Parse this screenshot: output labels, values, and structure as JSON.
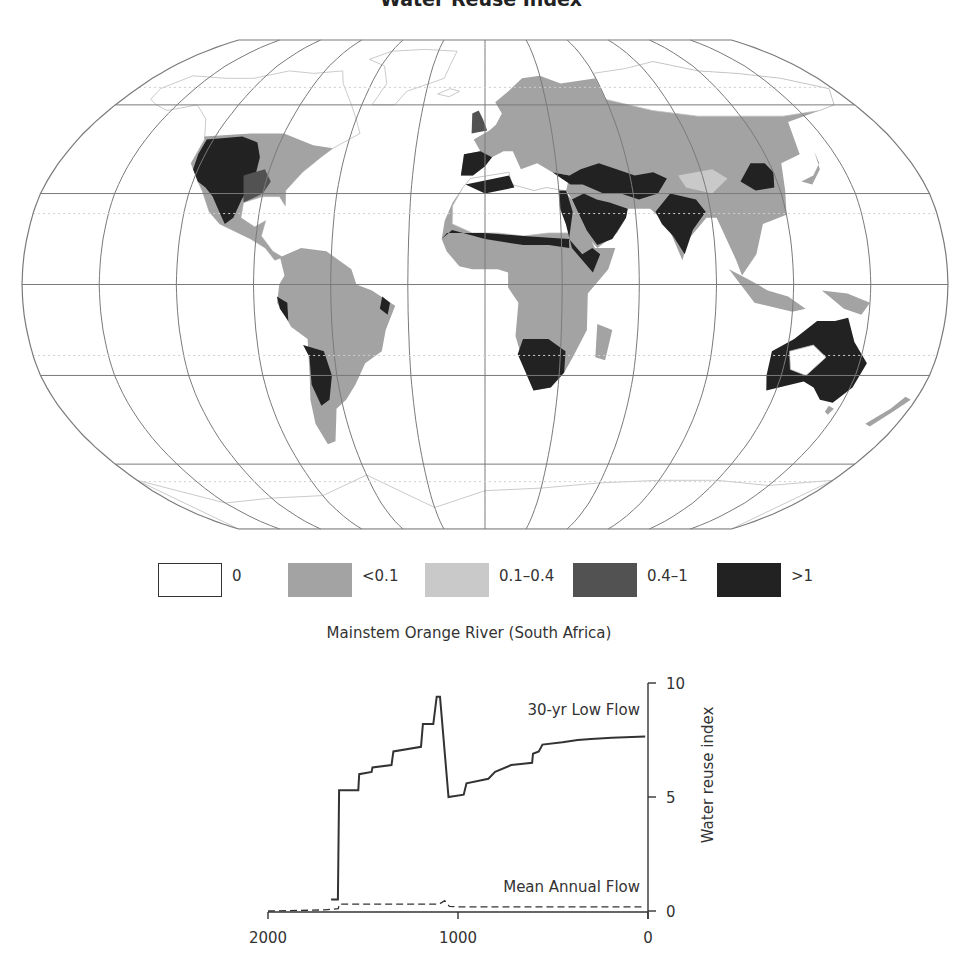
{
  "map": {
    "title": "Water Reuse Index",
    "projection": "Robinson",
    "frame": {
      "cx": 485,
      "cy": 284,
      "halfWidth": 463,
      "top": 40,
      "bottom": 529
    },
    "colors": {
      "zero": "#ffffff",
      "lt01": "#a3a3a3",
      "r01_04": "#c9c9c9",
      "r04_1": "#525252",
      "gt1": "#222222",
      "graticule": "#7a7a7a",
      "coast": "#bdbdbd"
    }
  },
  "legend": {
    "items": [
      {
        "label": "0",
        "color": "#ffffff",
        "outlined": true,
        "x": 158
      },
      {
        "label": "<0.1",
        "color": "#a3a3a3",
        "outlined": false,
        "x": 288
      },
      {
        "label": "0.1–0.4",
        "color": "#c9c9c9",
        "outlined": false,
        "x": 425
      },
      {
        "label": "0.4–1",
        "color": "#525252",
        "outlined": false,
        "x": 573
      },
      {
        "label": ">1",
        "color": "#222222",
        "outlined": false,
        "x": 717
      }
    ]
  },
  "chart_data": {
    "type": "line",
    "title": "Mainstem Orange River (South Africa)",
    "xlabel": "",
    "ylabel": "Water reuse index",
    "xlim": [
      2000,
      0
    ],
    "ylim": [
      0,
      10
    ],
    "x_ticks": [
      2000,
      1000,
      0
    ],
    "y_ticks": [
      0,
      5,
      10
    ],
    "y_axis_position": "right",
    "grid": false,
    "series": [
      {
        "name": "30-yr Low Flow",
        "style": "solid",
        "label_pos": {
          "x": 1000,
          "y": 8.6
        },
        "points": [
          [
            1668,
            0.5
          ],
          [
            1632,
            0.5
          ],
          [
            1626,
            5.3
          ],
          [
            1525,
            5.3
          ],
          [
            1520,
            6.0
          ],
          [
            1455,
            6.1
          ],
          [
            1450,
            6.3
          ],
          [
            1350,
            6.4
          ],
          [
            1340,
            7.0
          ],
          [
            1195,
            7.2
          ],
          [
            1185,
            8.2
          ],
          [
            1130,
            8.2
          ],
          [
            1112,
            9.4
          ],
          [
            1095,
            9.4
          ],
          [
            1050,
            5.0
          ],
          [
            970,
            5.1
          ],
          [
            955,
            5.6
          ],
          [
            840,
            5.8
          ],
          [
            805,
            6.1
          ],
          [
            720,
            6.4
          ],
          [
            610,
            6.5
          ],
          [
            605,
            6.9
          ],
          [
            575,
            7.0
          ],
          [
            555,
            7.3
          ],
          [
            450,
            7.4
          ],
          [
            370,
            7.5
          ],
          [
            300,
            7.55
          ],
          [
            190,
            7.6
          ],
          [
            15,
            7.65
          ]
        ]
      },
      {
        "name": "Mean Annual Flow",
        "style": "dashed",
        "label_pos": {
          "x": 1000,
          "y": 0.85
        },
        "points": [
          [
            2000,
            0.0
          ],
          [
            1700,
            0.05
          ],
          [
            1630,
            0.1
          ],
          [
            1626,
            0.3
          ],
          [
            1100,
            0.3
          ],
          [
            1070,
            0.45
          ],
          [
            1045,
            0.2
          ],
          [
            1000,
            0.18
          ],
          [
            15,
            0.18
          ]
        ]
      }
    ],
    "plot_px": {
      "x0": 268,
      "x1": 648,
      "y0": 911,
      "y1": 683
    }
  }
}
